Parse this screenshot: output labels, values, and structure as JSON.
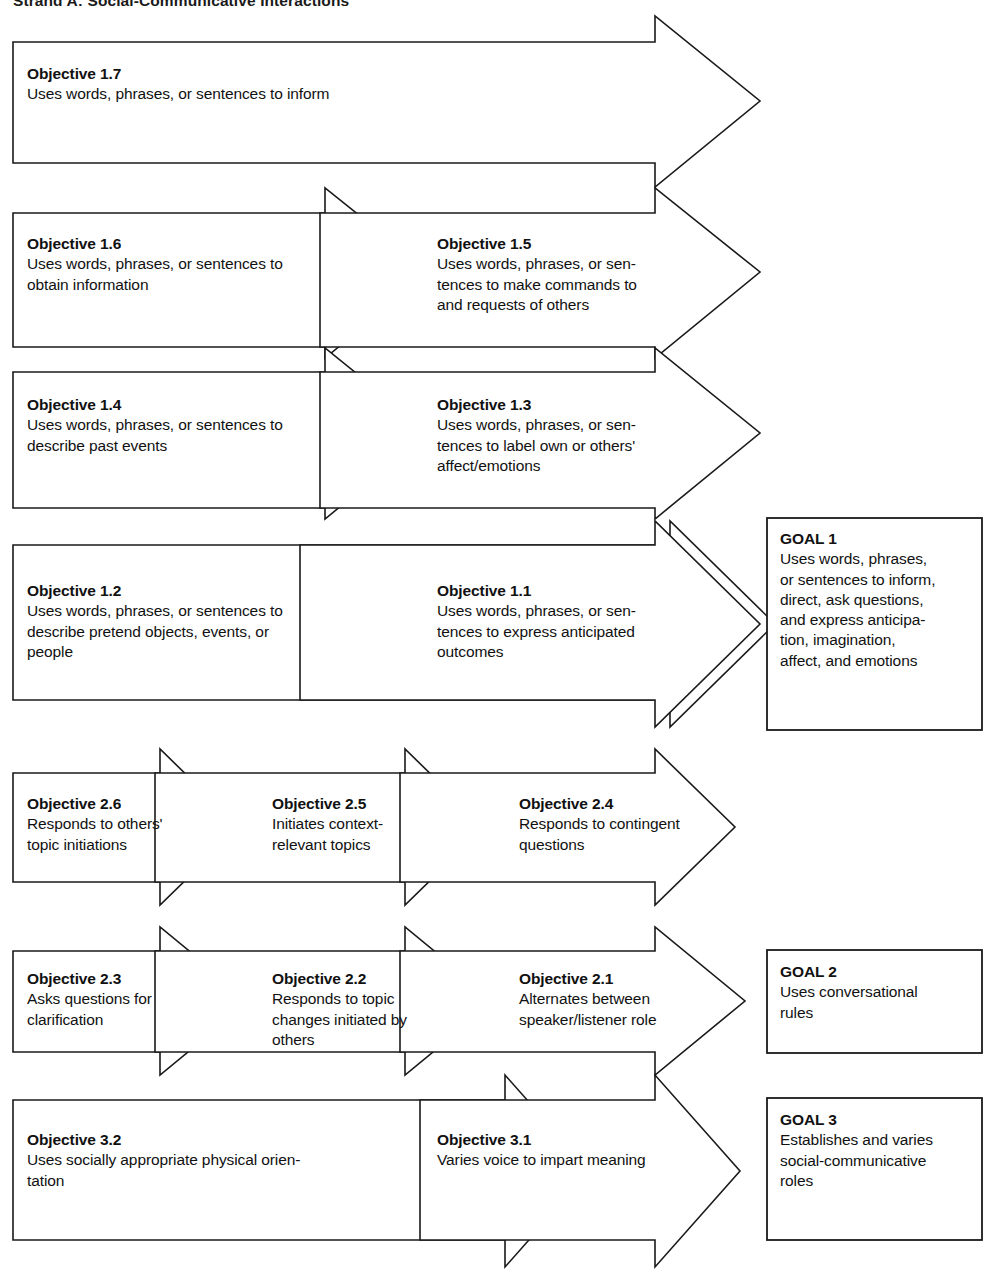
{
  "title": "Strand A: Social-Communicative Interactions",
  "diagram": {
    "type": "goal-objective flow chart",
    "orientation": "right-pointing chevron arrows leading to goal boxes",
    "colors": {
      "stroke": "#1a1a1a",
      "fill": "#ffffff",
      "text": "#111111"
    }
  },
  "rows": [
    {
      "id": "row-1",
      "cells": [
        {
          "name": "objective-1-7",
          "heading": "Objective 1.7",
          "body": "Uses words, phrases, or sentences to inform"
        }
      ]
    },
    {
      "id": "row-2",
      "cells": [
        {
          "name": "objective-1-6",
          "heading": "Objective 1.6",
          "body": "Uses words, phrases, or sentences to\nobtain information"
        },
        {
          "name": "objective-1-5",
          "heading": "Objective 1.5",
          "body": "Uses words, phrases, or sen-\ntences to make commands to\nand requests of others"
        }
      ]
    },
    {
      "id": "row-3",
      "cells": [
        {
          "name": "objective-1-4",
          "heading": "Objective 1.4",
          "body": "Uses words, phrases, or sentences to\ndescribe past events"
        },
        {
          "name": "objective-1-3",
          "heading": "Objective 1.3",
          "body": "Uses words, phrases, or sen-\ntences to label own or others'\naffect/emotions"
        }
      ]
    },
    {
      "id": "row-4",
      "cells": [
        {
          "name": "objective-1-2",
          "heading": "Objective 1.2",
          "body": "Uses words, phrases, or sentences to\ndescribe pretend objects, events, or\npeople"
        },
        {
          "name": "objective-1-1",
          "heading": "Objective 1.1",
          "body": "Uses words, phrases, or sen-\ntences to express anticipated\noutcomes"
        }
      ],
      "goal": {
        "name": "goal-1",
        "heading": "GOAL 1",
        "body": "Uses words, phrases,\nor sentences to inform,\ndirect, ask questions,\nand express anticipa-\ntion, imagination,\naffect, and emotions"
      }
    },
    {
      "id": "row-5",
      "cells": [
        {
          "name": "objective-2-6",
          "heading": "Objective 2.6",
          "body": "Responds to others'\ntopic initiations"
        },
        {
          "name": "objective-2-5",
          "heading": "Objective 2.5",
          "body": "Initiates context-\nrelevant topics"
        },
        {
          "name": "objective-2-4",
          "heading": "Objective 2.4",
          "body": "Responds to contingent\nquestions"
        }
      ]
    },
    {
      "id": "row-6",
      "cells": [
        {
          "name": "objective-2-3",
          "heading": "Objective 2.3",
          "body": "Asks questions for\nclarification"
        },
        {
          "name": "objective-2-2",
          "heading": "Objective 2.2",
          "body": "Responds to topic\nchanges initiated by\nothers"
        },
        {
          "name": "objective-2-1",
          "heading": "Objective 2.1",
          "body": "Alternates between\nspeaker/listener role"
        }
      ],
      "goal": {
        "name": "goal-2",
        "heading": "GOAL 2",
        "body": "Uses conversational\nrules"
      }
    },
    {
      "id": "row-7",
      "cells": [
        {
          "name": "objective-3-2",
          "heading": "Objective 3.2",
          "body": "Uses socially appropriate physical orien-\ntation"
        },
        {
          "name": "objective-3-1",
          "heading": "Objective 3.1",
          "body": "Varies voice to impart meaning"
        }
      ],
      "goal": {
        "name": "goal-3",
        "heading": "GOAL 3",
        "body": "Establishes and varies\nsocial-communicative\nroles"
      }
    }
  ]
}
